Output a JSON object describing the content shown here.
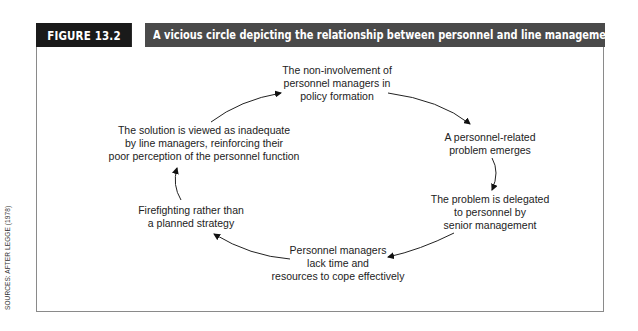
{
  "figure": {
    "label": "FIGURE 13.2",
    "title": "A vicious circle depicting the relationship between personnel and line management",
    "label_bg": "#1a1a1a",
    "title_bg": "#4a4a4a"
  },
  "source": "SOURCES: AFTER LEGGE (1978)",
  "cycle": {
    "nodes": [
      {
        "id": "n1",
        "lines": [
          "The non-involvement of",
          "personnel managers in",
          "policy formation"
        ]
      },
      {
        "id": "n2",
        "lines": [
          "A personnel-related",
          "problem emerges"
        ]
      },
      {
        "id": "n3",
        "lines": [
          "The problem is delegated",
          "to personnel by",
          "senior management"
        ]
      },
      {
        "id": "n4",
        "lines": [
          "Personnel managers",
          "lack time and",
          "resources to cope effectively"
        ]
      },
      {
        "id": "n5",
        "lines": [
          "Firefighting rather than",
          "a planned strategy"
        ]
      },
      {
        "id": "n6",
        "lines": [
          "The solution is viewed as inadequate",
          "by line managers, reinforcing their",
          "poor perception of the personnel function"
        ]
      }
    ],
    "edges": [
      {
        "from": "n1",
        "to": "n2"
      },
      {
        "from": "n2",
        "to": "n3"
      },
      {
        "from": "n3",
        "to": "n4"
      },
      {
        "from": "n4",
        "to": "n5"
      },
      {
        "from": "n5",
        "to": "n6"
      },
      {
        "from": "n6",
        "to": "n1"
      }
    ]
  }
}
